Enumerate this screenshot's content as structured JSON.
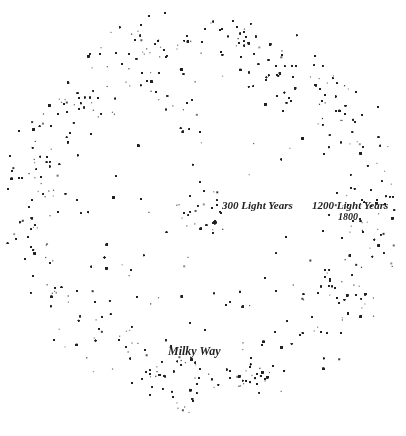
{
  "figure": {
    "title": "",
    "labels": {
      "inner_radius": "300 Light Years",
      "outer_radius": "1200 Light Years",
      "year": "1800",
      "milky_way": "Milky Way"
    },
    "colors": {
      "ink": "#222222",
      "background": "#ffffff"
    },
    "regions": [
      {
        "name": "core",
        "radius_ly": 0
      },
      {
        "name": "inner-ring",
        "radius_ly": 300
      },
      {
        "name": "outer-ring",
        "radius_ly": 1200
      }
    ]
  }
}
